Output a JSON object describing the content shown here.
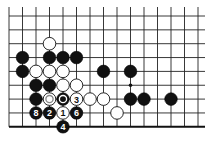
{
  "diagram": {
    "type": "go-board-problem",
    "colors": {
      "black": "#111111",
      "white": "#ffffff",
      "line": "#222222",
      "background": "#ffffff"
    },
    "grid": {
      "origin_x": 9,
      "origin_y": 16,
      "spacing_x": 13.5,
      "spacing_y": 13.85,
      "columns": 15,
      "rows": 9,
      "line_top_extent": 7,
      "line_right_extent": 205,
      "bottom_edge": true
    },
    "hoshi": [
      {
        "col": 9,
        "row": 5
      }
    ],
    "stones": [
      {
        "col": 3,
        "row": 2,
        "color": "white",
        "label": ""
      },
      {
        "col": 1,
        "row": 3,
        "color": "black",
        "label": ""
      },
      {
        "col": 3,
        "row": 3,
        "color": "black",
        "label": ""
      },
      {
        "col": 4,
        "row": 3,
        "color": "black",
        "label": ""
      },
      {
        "col": 5,
        "row": 3,
        "color": "black",
        "label": ""
      },
      {
        "col": 1,
        "row": 4,
        "color": "black",
        "label": ""
      },
      {
        "col": 2,
        "row": 4,
        "color": "white",
        "label": ""
      },
      {
        "col": 3,
        "row": 4,
        "color": "white",
        "label": ""
      },
      {
        "col": 4,
        "row": 4,
        "color": "white",
        "label": ""
      },
      {
        "col": 7,
        "row": 4,
        "color": "black",
        "label": ""
      },
      {
        "col": 9,
        "row": 4,
        "color": "black",
        "label": ""
      },
      {
        "col": 2,
        "row": 5,
        "color": "black",
        "label": ""
      },
      {
        "col": 3,
        "row": 5,
        "color": "black",
        "label": ""
      },
      {
        "col": 4,
        "row": 5,
        "color": "white",
        "label": ""
      },
      {
        "col": 5,
        "row": 5,
        "color": "white",
        "label": ""
      },
      {
        "col": 2,
        "row": 6,
        "color": "black",
        "label": ""
      },
      {
        "col": 3,
        "row": 6,
        "color": "white",
        "label": "",
        "marker": "inner-ring"
      },
      {
        "col": 4,
        "row": 6,
        "color": "black",
        "label": "",
        "marker": "inner-ring"
      },
      {
        "col": 5,
        "row": 6,
        "color": "white",
        "label": "3"
      },
      {
        "col": 6,
        "row": 6,
        "color": "white",
        "label": ""
      },
      {
        "col": 7,
        "row": 6,
        "color": "white",
        "label": ""
      },
      {
        "col": 9,
        "row": 6,
        "color": "black",
        "label": ""
      },
      {
        "col": 10,
        "row": 6,
        "color": "black",
        "label": ""
      },
      {
        "col": 12,
        "row": 6,
        "color": "black",
        "label": ""
      },
      {
        "col": 2,
        "row": 7,
        "color": "black",
        "label": "8"
      },
      {
        "col": 3,
        "row": 7,
        "color": "black",
        "label": "2"
      },
      {
        "col": 4,
        "row": 7,
        "color": "white",
        "label": "1"
      },
      {
        "col": 5,
        "row": 7,
        "color": "black",
        "label": "6"
      },
      {
        "col": 8,
        "row": 7,
        "color": "white",
        "label": ""
      },
      {
        "col": 4,
        "row": 8,
        "color": "black",
        "label": "4"
      }
    ]
  }
}
